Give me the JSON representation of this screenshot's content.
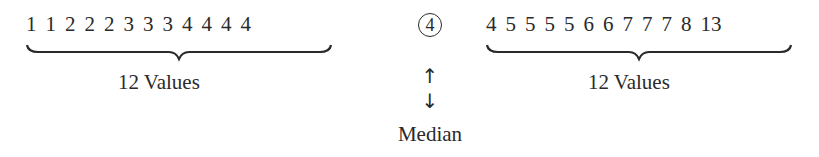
{
  "diagram": {
    "lower_half": {
      "values": [
        "1",
        "1",
        "2",
        "2",
        "2",
        "3",
        "3",
        "3",
        "4",
        "4",
        "4",
        "4"
      ],
      "label": "12 Values"
    },
    "median": {
      "value": "4",
      "up_arrow": "↑",
      "down_arrow": "↓",
      "label": "Median"
    },
    "upper_half": {
      "values": [
        "4",
        "5",
        "5",
        "5",
        "5",
        "6",
        "6",
        "7",
        "7",
        "7",
        "8",
        "13"
      ],
      "label": "12 Values"
    }
  }
}
